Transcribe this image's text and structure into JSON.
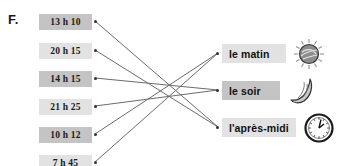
{
  "exercise": {
    "letter": "F."
  },
  "times": [
    {
      "label": "13 h 10",
      "shade": "dark",
      "top": 14,
      "dot_y": 21
    },
    {
      "label": "20 h 15",
      "shade": "light",
      "top": 43,
      "dot_y": 50
    },
    {
      "label": "14 h 15",
      "shade": "dark",
      "top": 71,
      "dot_y": 78
    },
    {
      "label": "21 h 25",
      "shade": "light",
      "top": 99,
      "dot_y": 106
    },
    {
      "label": "10 h 12",
      "shade": "dark",
      "top": 127,
      "dot_y": 134
    },
    {
      "label": "7 h 45",
      "shade": "light",
      "top": 155,
      "dot_y": 162
    }
  ],
  "periods": [
    {
      "label": "le matin",
      "icon": "sun-icon",
      "shade": "light",
      "top": 44,
      "dot_y": 53,
      "width": 64
    },
    {
      "label": "le soir",
      "icon": "moon-icon",
      "shade": "dark",
      "top": 81,
      "dot_y": 90,
      "width": 58
    },
    {
      "label": "l'après-midi",
      "icon": "clock-icon",
      "shade": "light",
      "top": 118,
      "dot_y": 127,
      "width": 74
    }
  ],
  "connections": [
    {
      "from": "13 h 10",
      "to": "l'après-midi",
      "x1": 95,
      "y1": 21,
      "x2": 218,
      "y2": 127
    },
    {
      "from": "20 h 15",
      "to": "l'après-midi",
      "x1": 95,
      "y1": 50,
      "x2": 218,
      "y2": 127
    },
    {
      "from": "14 h 15",
      "to": "le soir",
      "x1": 95,
      "y1": 78,
      "x2": 218,
      "y2": 90
    },
    {
      "from": "21 h 25",
      "to": "le soir",
      "x1": 95,
      "y1": 106,
      "x2": 218,
      "y2": 90
    },
    {
      "from": "10 h 12",
      "to": "le matin",
      "x1": 95,
      "y1": 134,
      "x2": 218,
      "y2": 53
    },
    {
      "from": "7 h 45",
      "to": "le matin",
      "x1": 95,
      "y1": 162,
      "x2": 218,
      "y2": 53
    }
  ],
  "colors": {
    "shade_dark": "#c4c4c4",
    "shade_light": "#e2e2e2",
    "line": "#6b6b6b",
    "text": "#111111"
  }
}
